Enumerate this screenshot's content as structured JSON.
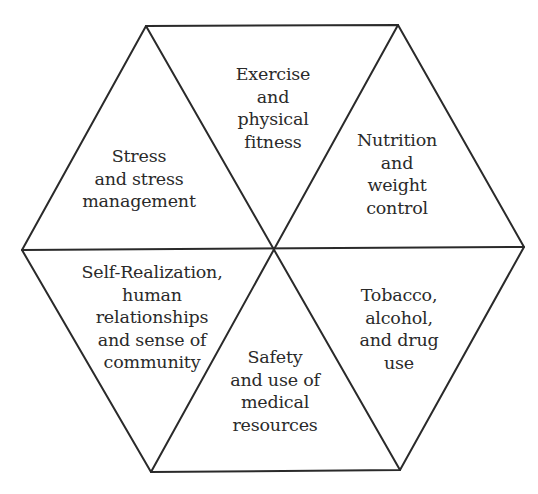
{
  "diagram": {
    "type": "hexagon",
    "segments": [
      {
        "id": "exercise",
        "lines": [
          "Exercise",
          "and",
          "physical",
          "fitness"
        ]
      },
      {
        "id": "nutrition",
        "lines": [
          "Nutrition",
          "and",
          "weight",
          "control"
        ]
      },
      {
        "id": "stress",
        "lines": [
          "Stress",
          "and stress",
          "management"
        ]
      },
      {
        "id": "self-realization",
        "lines": [
          "Self-Realization,",
          "human",
          "relationships",
          "and sense of",
          "community"
        ]
      },
      {
        "id": "tobacco",
        "lines": [
          "Tobacco,",
          "alcohol,",
          "and drug",
          "use"
        ]
      },
      {
        "id": "safety",
        "lines": [
          "Safety",
          "and use of",
          "medical",
          "resources"
        ]
      }
    ],
    "colors": {
      "line": "#2a2a2a",
      "text": "#2a2a2a",
      "background": "#ffffff"
    }
  }
}
